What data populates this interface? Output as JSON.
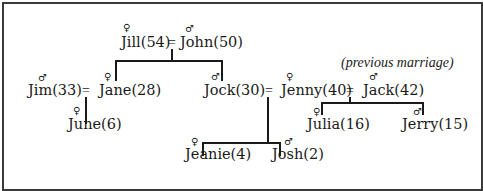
{
  "diagram": {
    "type": "family-tree",
    "annotation": "(previous marriage)",
    "symbols": {
      "female": "♀",
      "male": "♂",
      "marriage": "="
    },
    "people": [
      {
        "id": "jill",
        "name": "Jill",
        "age": 54,
        "label": "Jill(54)",
        "sex": "female"
      },
      {
        "id": "john",
        "name": "John",
        "age": 50,
        "label": "John(50)",
        "sex": "male"
      },
      {
        "id": "jim",
        "name": "Jim",
        "age": 33,
        "label": "Jim(33)",
        "sex": "male"
      },
      {
        "id": "jane",
        "name": "Jane",
        "age": 28,
        "label": "Jane(28)",
        "sex": "female"
      },
      {
        "id": "jock",
        "name": "Jock",
        "age": 30,
        "label": "Jock(30)",
        "sex": "male"
      },
      {
        "id": "jenny",
        "name": "Jenny",
        "age": 40,
        "label": "Jenny(40)",
        "sex": "female"
      },
      {
        "id": "jack",
        "name": "Jack",
        "age": 42,
        "label": "Jack(42)",
        "sex": "male"
      },
      {
        "id": "june",
        "name": "June",
        "age": 6,
        "label": "June(6)",
        "sex": "female"
      },
      {
        "id": "julia",
        "name": "Julia",
        "age": 16,
        "label": "Julia(16)",
        "sex": "female"
      },
      {
        "id": "jerry",
        "name": "Jerry",
        "age": 15,
        "label": "Jerry(15)",
        "sex": "male"
      },
      {
        "id": "jeanie",
        "name": "Jeanie",
        "age": 4,
        "label": "Jeanie(4)",
        "sex": "female"
      },
      {
        "id": "josh",
        "name": "Josh",
        "age": 2,
        "label": "Josh(2)",
        "sex": "male"
      }
    ],
    "marriages": [
      {
        "partners": [
          "jill",
          "john"
        ],
        "children": [
          "jane",
          "jock"
        ]
      },
      {
        "partners": [
          "jim",
          "jane"
        ],
        "children": [
          "june"
        ]
      },
      {
        "partners": [
          "jock",
          "jenny"
        ],
        "children": [
          "jeanie",
          "josh"
        ]
      },
      {
        "partners": [
          "jenny",
          "jack"
        ],
        "children": [
          "julia",
          "jerry"
        ],
        "note": "previous marriage"
      }
    ]
  }
}
